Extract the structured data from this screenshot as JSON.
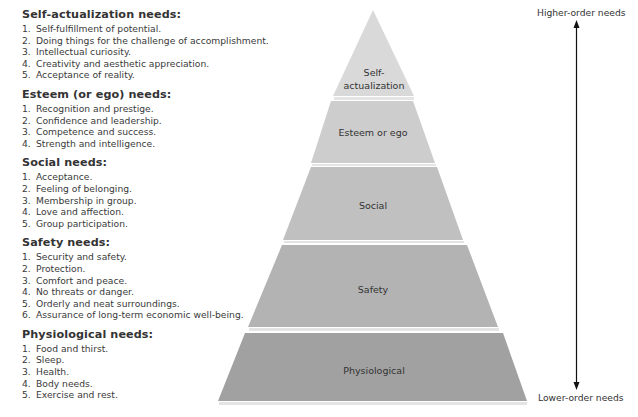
{
  "needs": [
    {
      "heading": "Self-actualization needs:",
      "items": [
        {
          "num": "1.",
          "text": "Self-fulfillment of potential."
        },
        {
          "num": "2.",
          "text": "Doing things for the challenge of accomplishment."
        },
        {
          "num": "3.",
          "text": "Intellectual curiosity."
        },
        {
          "num": "4.",
          "text": "Creativity and aesthetic appreciation."
        },
        {
          "num": "5.",
          "text": "Acceptance of reality."
        }
      ]
    },
    {
      "heading": "Esteem (or ego) needs:",
      "items": [
        {
          "num": "1.",
          "text": "Recognition and prestige."
        },
        {
          "num": "2.",
          "text": "Confidence and leadership."
        },
        {
          "num": "3.",
          "text": "Competence and success."
        },
        {
          "num": "4.",
          "text": "Strength and intelligence."
        }
      ]
    },
    {
      "heading": "Social needs:",
      "items": [
        {
          "num": "1.",
          "text": "Acceptance."
        },
        {
          "num": "2.",
          "text": "Feeling of belonging."
        },
        {
          "num": "3.",
          "text": "Membership in group."
        },
        {
          "num": "4.",
          "text": "Love and affection."
        },
        {
          "num": "5.",
          "text": "Group participation."
        }
      ]
    },
    {
      "heading": "Safety needs:",
      "items": [
        {
          "num": "1.",
          "text": "Security and safety."
        },
        {
          "num": "2.",
          "text": "Protection."
        },
        {
          "num": "3.",
          "text": "Comfort and peace."
        },
        {
          "num": "4.",
          "text": "No threats or danger."
        },
        {
          "num": "5.",
          "text": "Orderly and neat surroundings."
        },
        {
          "num": "6.",
          "text": "Assurance of long-term economic well-being."
        }
      ]
    },
    {
      "heading": "Physiological needs:",
      "items": [
        {
          "num": "1.",
          "text": "Food and thirst."
        },
        {
          "num": "2.",
          "text": "Sleep."
        },
        {
          "num": "3.",
          "text": "Health."
        },
        {
          "num": "4.",
          "text": "Body needs."
        },
        {
          "num": "5.",
          "text": "Exercise and rest."
        }
      ]
    }
  ],
  "pyramid": {
    "tiers": [
      {
        "label_lines": [
          "Self-",
          "actualization"
        ],
        "color": "#d9d9d9"
      },
      {
        "label_lines": [
          "Esteem or ego"
        ],
        "color": "#cdcdcd"
      },
      {
        "label_lines": [
          "Social"
        ],
        "color": "#c0c0c0"
      },
      {
        "label_lines": [
          "Safety"
        ],
        "color": "#b3b3b3"
      },
      {
        "label_lines": [
          "Physiological"
        ],
        "color": "#a1a1a1"
      }
    ]
  },
  "axis": {
    "top_label": "Higher-order needs",
    "bottom_label": "Lower-order needs",
    "arrow_color": "#111111"
  }
}
